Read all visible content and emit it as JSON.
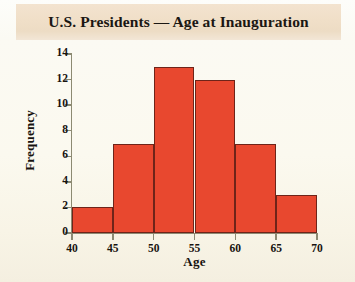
{
  "chart_data": {
    "type": "bar",
    "title": "U.S. Presidents — Age at Inauguration",
    "xlabel": "Age",
    "ylabel": "Frequency",
    "categories": [
      "40–45",
      "45–50",
      "50–55",
      "55–60",
      "60–65",
      "65–70"
    ],
    "bin_edges": [
      40,
      45,
      50,
      55,
      60,
      65,
      70
    ],
    "values": [
      2,
      7,
      13,
      12,
      7,
      3
    ],
    "xlim": [
      40,
      70
    ],
    "ylim": [
      0,
      14
    ],
    "xticks": [
      40,
      45,
      50,
      55,
      60,
      65,
      70
    ],
    "yticks": [
      0,
      2,
      4,
      6,
      8,
      10,
      12,
      14
    ],
    "grid": false,
    "legend": null,
    "bar_color": "#e8482f",
    "bar_edge_color": "#6e2419",
    "axis_color": "#8c8a72",
    "title_banner_color": "#f0dfc8",
    "background_color": "#fbf9ef"
  }
}
